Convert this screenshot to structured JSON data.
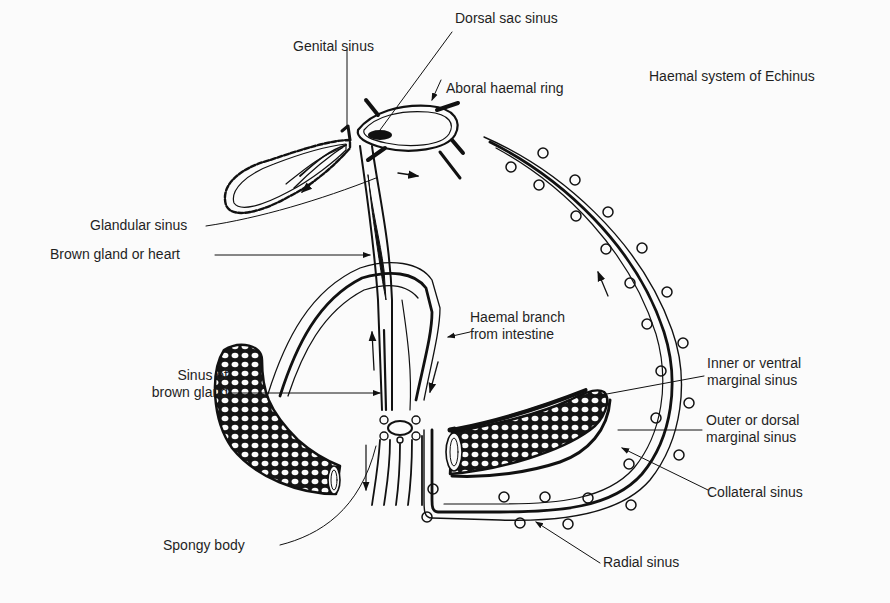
{
  "title": "Haemal system of Echinus",
  "labels": {
    "dorsal_sac_sinus": "Dorsal sac sinus",
    "genital_sinus": "Genital sinus",
    "aboral_haemal_ring": "Aboral haemal ring",
    "glandular_sinus": "Glandular sinus",
    "brown_gland_or_heart": "Brown gland or heart",
    "haemal_branch_line1": "Haemal branch",
    "haemal_branch_line2": "from intestine",
    "sinus_brown_gland_line1": "Sinus of",
    "sinus_brown_gland_line2": "brown gland",
    "inner_ventral_line1": "Inner or ventral",
    "inner_ventral_line2": "marginal sinus",
    "outer_dorsal_line1": "Outer or dorsal",
    "outer_dorsal_line2": "marginal sinus",
    "collateral_sinus": "Collateral sinus",
    "spongy_body": "Spongy body",
    "radial_sinus": "Radial sinus"
  },
  "colors": {
    "background": "#fbfbfb",
    "ink": "#111111"
  }
}
